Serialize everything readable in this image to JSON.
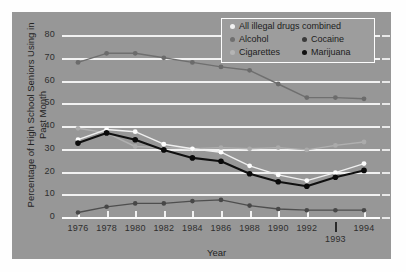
{
  "chart_data": {
    "type": "line",
    "title": "",
    "xlabel": "Year",
    "ylabel": "Percentage of High School Seniors Using in Past Month",
    "ylabel_line1": "Percentage of High School",
    "ylabel_line2": "Seniors Using in Past Month",
    "categories": [
      "1976",
      "1978",
      "1980",
      "1982",
      "1984",
      "1986",
      "1988",
      "1990",
      "1992",
      "1993",
      "1994"
    ],
    "x_tick_labels": [
      "1976",
      "1978",
      "1980",
      "1982",
      "1984",
      "1986",
      "1988",
      "1990",
      "1992",
      "1994"
    ],
    "x_extra_label": "1993",
    "y_tick_labels": [
      "0",
      "10",
      "20",
      "30",
      "40",
      "50",
      "60",
      "70",
      "80"
    ],
    "y_ticks": [
      0,
      10,
      20,
      30,
      40,
      50,
      60,
      70,
      80
    ],
    "ylim": [
      0,
      84
    ],
    "grid": true,
    "legend_position": "top-right",
    "series": [
      {
        "name": "All illegal drugs combined",
        "color": "#f2f2f2",
        "values": [
          34,
          38.5,
          37.5,
          32,
          30,
          28.5,
          22.5,
          18.5,
          16,
          19.5,
          23.5
        ]
      },
      {
        "name": "Alcohol",
        "color": "#6f6f6f",
        "values": [
          68,
          72,
          72,
          70,
          68,
          66,
          64.5,
          58.5,
          52.5,
          52.5,
          52
        ]
      },
      {
        "name": "Cigarettes",
        "color": "#b4b4b4",
        "values": [
          39,
          37,
          31,
          30.5,
          30,
          30.5,
          30,
          30.5,
          29.5,
          31.5,
          33
        ]
      },
      {
        "name": "Cocaine",
        "color": "#555555",
        "values": [
          2,
          4.5,
          6,
          6,
          7,
          7.5,
          5,
          3.5,
          3,
          3,
          3
        ]
      },
      {
        "name": "Marijuana",
        "color": "#111111",
        "values": [
          32.5,
          37,
          34,
          29.5,
          26,
          24.5,
          19,
          15.5,
          13.5,
          17.5,
          20.5
        ]
      }
    ]
  },
  "legend": {
    "rows": [
      {
        "items": [
          {
            "label": "All illegal drugs combined",
            "color": "#f2f2f2"
          }
        ]
      },
      {
        "items": [
          {
            "label": "Alcohol",
            "color": "#6f6f6f"
          },
          {
            "label": "Cocaine",
            "color": "#3a3a3a"
          }
        ]
      },
      {
        "items": [
          {
            "label": "Cigarettes",
            "color": "#b4b4b4"
          },
          {
            "label": "Marijuana",
            "color": "#111111"
          }
        ]
      }
    ]
  },
  "colors": {
    "panel_background": "#979797",
    "gridline": "#f2f2f2",
    "page_background": "#fefefe",
    "text": "#232323"
  }
}
